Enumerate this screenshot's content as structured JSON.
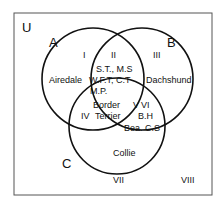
{
  "diagram": {
    "type": "venn-3-set",
    "universe_label": "U",
    "sets": [
      {
        "label": "A",
        "name": "set-a"
      },
      {
        "label": "B",
        "name": "set-b"
      },
      {
        "label": "C",
        "name": "set-c"
      }
    ],
    "region_labels": {
      "I": "I",
      "II": "II",
      "III": "III",
      "IV": "IV",
      "V": "V",
      "VI": "VI",
      "VII": "VII",
      "VIII": "VIII"
    },
    "elements": {
      "airedale": "Airedale",
      "dachshund": "Dachshund",
      "ab_line1": "S.T., M.S",
      "ab_line2": "W.F.T, C.T",
      "ab_line3": "M.P.",
      "abc_line1": "Border",
      "abc_line2": "Terrier",
      "bc_line1": "B.H",
      "bc_line2": "Bea. C.S",
      "collie": "Collie"
    },
    "colors": {
      "stroke": "#111111",
      "background": "#ffffff",
      "frame": "#555555"
    }
  }
}
